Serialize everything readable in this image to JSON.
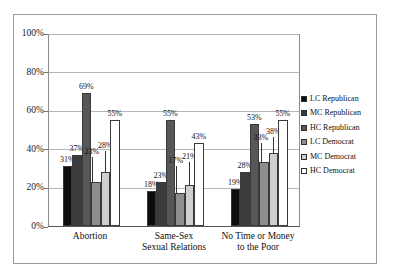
{
  "chart_data": {
    "type": "bar",
    "title": "",
    "subtitle": "",
    "xlabel": "",
    "ylabel": "",
    "ylim": [
      0,
      100
    ],
    "ytick_labels": [
      "100%",
      "80%",
      "60%",
      "40%",
      "20%",
      "0%"
    ],
    "ytick_values": [
      100,
      80,
      60,
      40,
      20,
      0
    ],
    "grid": true,
    "legend_position": "right",
    "categories": [
      "Abortion",
      "Same-Sex\nSexual Relations",
      "No Time or Money\nto the Poor"
    ],
    "category_lines": [
      [
        "Abortion"
      ],
      [
        "Same-Sex",
        "Sexual Relations"
      ],
      [
        "No Time or Money",
        "to the Poor"
      ]
    ],
    "series": [
      {
        "name": "LC Republican",
        "color": "#0d0d0d",
        "values": [
          31,
          18,
          19
        ],
        "labels": [
          "31%",
          "18%",
          "19%"
        ]
      },
      {
        "name": "MC Republican",
        "color": "#3c3c3c",
        "values": [
          37,
          23,
          28
        ],
        "labels": [
          "37%",
          "23%",
          "28%"
        ]
      },
      {
        "name": "HC Republican",
        "color": "#575757",
        "values": [
          69,
          55,
          53
        ],
        "labels": [
          "69%",
          "55%",
          "53%"
        ]
      },
      {
        "name": "LC Democrat",
        "color": "#8e8e8e",
        "values": [
          23,
          17,
          33
        ],
        "labels": [
          "23%",
          "17%",
          "33%"
        ]
      },
      {
        "name": "MC Democrat",
        "color": "#cfcfcf",
        "values": [
          28,
          21,
          38
        ],
        "labels": [
          "28%",
          "21%",
          "38%"
        ]
      },
      {
        "name": "HC Democrat",
        "color": "#ffffff",
        "values": [
          55,
          43,
          55
        ],
        "labels": [
          "55%",
          "43%",
          "55%"
        ]
      }
    ]
  },
  "legend": {
    "items": [
      {
        "label": "LC Republican",
        "color": "#0d0d0d"
      },
      {
        "label": "MC Republican",
        "color": "#3c3c3c"
      },
      {
        "label": "HC Republican",
        "color": "#575757"
      },
      {
        "label": "LC Democrat",
        "color": "#8e8e8e"
      },
      {
        "label": "MC Democrat",
        "color": "#cfcfcf"
      },
      {
        "label": "HC Democrat",
        "color": "#ffffff"
      }
    ]
  }
}
